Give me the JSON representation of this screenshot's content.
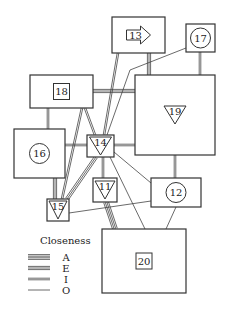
{
  "diagram": {
    "type": "activity-relationship layout",
    "nodes": [
      {
        "id": "13",
        "label": "13",
        "symbol": "arrow",
        "box": [
          112,
          17,
          53,
          36
        ]
      },
      {
        "id": "17",
        "label": "17",
        "symbol": "circle",
        "box": [
          186,
          24,
          29,
          28
        ]
      },
      {
        "id": "18",
        "label": "18",
        "symbol": "square",
        "box": [
          30,
          75,
          63,
          33
        ]
      },
      {
        "id": "19",
        "label": "19",
        "symbol": "triangle",
        "box": [
          135,
          75,
          80,
          80
        ]
      },
      {
        "id": "16",
        "label": "16",
        "symbol": "circle",
        "box": [
          14,
          129,
          51,
          49
        ]
      },
      {
        "id": "14",
        "label": "14",
        "symbol": "triangle",
        "box": [
          87,
          135,
          27,
          22
        ]
      },
      {
        "id": "11",
        "label": "11",
        "symbol": "triangle",
        "box": [
          93,
          178,
          24,
          24
        ]
      },
      {
        "id": "12",
        "label": "12",
        "symbol": "circle",
        "box": [
          151,
          178,
          50,
          29
        ]
      },
      {
        "id": "15",
        "label": "15",
        "symbol": "triangle",
        "box": [
          47,
          199,
          22,
          22
        ]
      },
      {
        "id": "20",
        "label": "20",
        "symbol": "square",
        "box": [
          102,
          229,
          84,
          64
        ]
      }
    ],
    "edges": [
      {
        "from": "13",
        "to": "14",
        "closeness": "I"
      },
      {
        "from": "13",
        "to": "19",
        "closeness": "E"
      },
      {
        "from": "17",
        "to": "19",
        "closeness": "I"
      },
      {
        "from": "17",
        "to": "14",
        "closeness": "O"
      },
      {
        "from": "18",
        "to": "19",
        "closeness": "E"
      },
      {
        "from": "18",
        "to": "16",
        "closeness": "I"
      },
      {
        "from": "18",
        "to": "14",
        "closeness": "I"
      },
      {
        "from": "18",
        "to": "15",
        "closeness": "I"
      },
      {
        "from": "16",
        "to": "14",
        "closeness": "I"
      },
      {
        "from": "16",
        "to": "15",
        "closeness": "E"
      },
      {
        "from": "14",
        "to": "19",
        "closeness": "I"
      },
      {
        "from": "14",
        "to": "11",
        "closeness": "I"
      },
      {
        "from": "14",
        "to": "15",
        "closeness": "E"
      },
      {
        "from": "14",
        "to": "12",
        "closeness": "O"
      },
      {
        "from": "14",
        "to": "20",
        "closeness": "O"
      },
      {
        "from": "19",
        "to": "12",
        "closeness": "I"
      },
      {
        "from": "11",
        "to": "20",
        "closeness": "A"
      },
      {
        "from": "12",
        "to": "15",
        "closeness": "O"
      },
      {
        "from": "12",
        "to": "20",
        "closeness": "O"
      }
    ]
  },
  "legend": {
    "title": "Closeness",
    "items": [
      {
        "code": "A",
        "lines": 4
      },
      {
        "code": "E",
        "lines": 3
      },
      {
        "code": "I",
        "lines": 2
      },
      {
        "code": "O",
        "lines": 1
      }
    ]
  }
}
